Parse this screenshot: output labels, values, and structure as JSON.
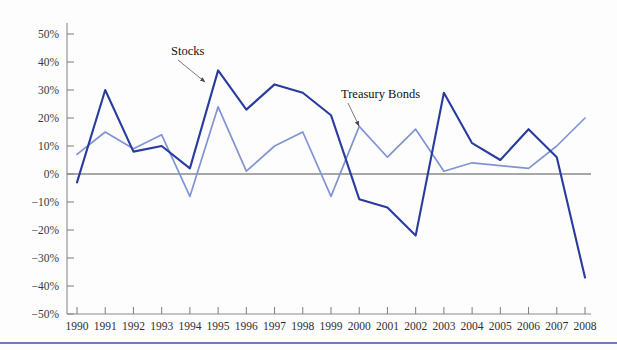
{
  "chart_data": {
    "type": "line",
    "title": "",
    "subtitle": "",
    "xlabel": "",
    "ylabel": "",
    "grid": false,
    "legend_position": "inline-annotation",
    "categories": [
      "1990",
      "1991",
      "1992",
      "1993",
      "1994",
      "1995",
      "1996",
      "1997",
      "1998",
      "1999",
      "2000",
      "2001",
      "2002",
      "2003",
      "2004",
      "2005",
      "2006",
      "2007",
      "2008"
    ],
    "x": [
      1990,
      1991,
      1992,
      1993,
      1994,
      1995,
      1996,
      1997,
      1998,
      1999,
      2000,
      2001,
      2002,
      2003,
      2004,
      2005,
      2006,
      2007,
      2008
    ],
    "xlim": [
      1990,
      2008
    ],
    "ylim": [
      -50,
      50
    ],
    "ytick_labels": [
      "50%",
      "40%",
      "30%",
      "20%",
      "10%",
      "0%",
      "−10%",
      "−20%",
      "−30%",
      "−40%",
      "−50%"
    ],
    "ytick_values": [
      50,
      40,
      30,
      20,
      10,
      0,
      -10,
      -20,
      -30,
      -40,
      -50
    ],
    "series": [
      {
        "name": "Stocks",
        "color": "#2a3b9e",
        "values": [
          -3,
          30,
          8,
          10,
          2,
          37,
          23,
          32,
          29,
          21,
          -9,
          -12,
          -22,
          29,
          11,
          5,
          16,
          6,
          -37
        ]
      },
      {
        "name": "Treasury Bonds",
        "color": "#8094d4",
        "values": [
          7,
          15,
          9,
          14,
          -8,
          24,
          1,
          10,
          15,
          -8,
          17,
          6,
          16,
          1,
          4,
          3,
          2,
          10,
          20
        ]
      }
    ],
    "annotations": [
      {
        "text": "Stocks",
        "target_x": 1995,
        "target_y": 33
      },
      {
        "text": "Treasury Bonds",
        "target_x": 2000,
        "target_y": 17
      }
    ]
  },
  "colors": {
    "stocks": "#2a3b9e",
    "treasury_bonds": "#8094d4",
    "axis": "#8c8c8c",
    "zero_line": "#8a8a8a",
    "footer_rule": "#3d4fa8",
    "background": "#fdfdfe"
  }
}
